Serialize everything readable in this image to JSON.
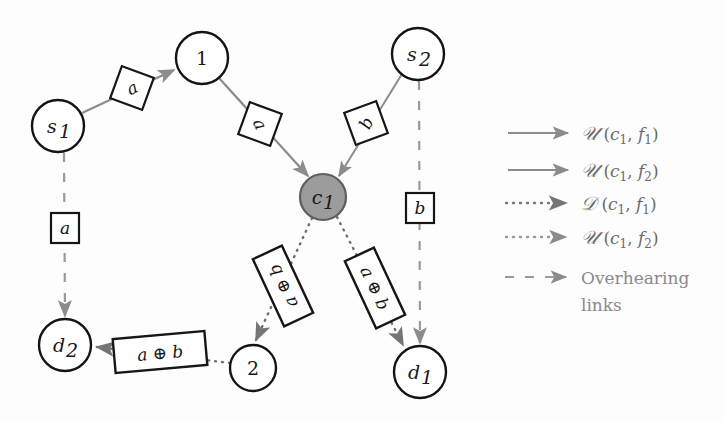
{
  "figure": {
    "background_color": "#fdfdfd",
    "line_color": "#8c8c8c",
    "stroke_color": "#1a1a1a",
    "coding_node_fill": "#9c9c9c"
  },
  "nodes": [
    {
      "id": "s1",
      "label": "s",
      "sub": "1",
      "x": 58,
      "y": 126,
      "r": 26,
      "fill": "#ffffff",
      "name": "node-s1"
    },
    {
      "id": "n1",
      "label": "1",
      "sub": "",
      "x": 202,
      "y": 58,
      "r": 26,
      "fill": "#ffffff",
      "name": "node-1"
    },
    {
      "id": "s2",
      "label": "s",
      "sub": "2",
      "x": 418,
      "y": 54,
      "r": 26,
      "fill": "#ffffff",
      "name": "node-s2"
    },
    {
      "id": "c1",
      "label": "c",
      "sub": "1",
      "x": 323,
      "y": 197,
      "r": 23,
      "fill": "#9c9c9c",
      "name": "node-c1"
    },
    {
      "id": "d2",
      "label": "d",
      "sub": "2",
      "x": 65,
      "y": 345,
      "r": 26,
      "fill": "#ffffff",
      "name": "node-d2"
    },
    {
      "id": "n2",
      "label": "2",
      "sub": "",
      "x": 253,
      "y": 368,
      "r": 23,
      "fill": "#ffffff",
      "name": "node-2"
    },
    {
      "id": "d1",
      "label": "d",
      "sub": "1",
      "x": 420,
      "y": 372,
      "r": 26,
      "fill": "#ffffff",
      "name": "node-d1"
    }
  ],
  "packet_labels": [
    {
      "id": "p-a-s1-n1",
      "text": "a",
      "x": 132,
      "y": 88,
      "w": 34,
      "h": 34,
      "rot": -25,
      "shape": "diamond",
      "name": "packet-label-a-s1-to-1"
    },
    {
      "id": "p-a-n1-c1",
      "text": "a",
      "x": 260,
      "y": 124,
      "w": 34,
      "h": 34,
      "rot": 65,
      "shape": "diamond",
      "name": "packet-label-a-1-to-c1"
    },
    {
      "id": "p-b-s2-c1",
      "text": "b",
      "x": 366,
      "y": 123,
      "w": 34,
      "h": 34,
      "rot": -65,
      "shape": "diamond",
      "name": "packet-label-b-s2-to-c1"
    },
    {
      "id": "p-a-over",
      "text": "a",
      "x": 65,
      "y": 228,
      "w": 28,
      "h": 30,
      "rot": 0,
      "shape": "rect",
      "name": "packet-label-a-overhear"
    },
    {
      "id": "p-b-over",
      "text": "b",
      "x": 420,
      "y": 208,
      "w": 28,
      "h": 30,
      "rot": 0,
      "shape": "rect",
      "name": "packet-label-b-overhear"
    },
    {
      "id": "p-ab-left",
      "text": "a ⊕ b",
      "x": 283,
      "y": 286,
      "w": 74,
      "h": 32,
      "rot": -115,
      "shape": "rect",
      "name": "packet-label-ab-c1-to-2"
    },
    {
      "id": "p-ab-right",
      "text": "a ⊕ b",
      "x": 375,
      "y": 288,
      "w": 74,
      "h": 32,
      "rot": 65,
      "shape": "rect",
      "name": "packet-label-ab-c1-to-d1"
    },
    {
      "id": "p-ab-bot",
      "text": "a ⊕ b",
      "x": 160,
      "y": 352,
      "w": 92,
      "h": 34,
      "rot": -5,
      "shape": "rect",
      "name": "packet-label-ab-2-to-d2"
    }
  ],
  "legend": {
    "rows": [
      {
        "id": "u-c1-f1",
        "style": "solid",
        "cal": "𝒰",
        "open": " (",
        "v1": "c",
        "v1s": "1",
        "comma": ", ",
        "v2": "f",
        "v2s": "1",
        "close": ")",
        "name": "legend-item-u-c1-f1"
      },
      {
        "id": "u-c1-f2",
        "style": "solid",
        "cal": "𝒰",
        "open": " (",
        "v1": "c",
        "v1s": "1",
        "comma": ", ",
        "v2": "f",
        "v2s": "2",
        "close": ")",
        "name": "legend-item-u-c1-f2"
      },
      {
        "id": "d-c1-f1",
        "style": "dotted",
        "cal": "𝒟",
        "open": " (",
        "v1": "c",
        "v1s": "1",
        "comma": ", ",
        "v2": "f",
        "v2s": "1",
        "close": ")",
        "name": "legend-item-d-c1-f1"
      },
      {
        "id": "u2-c1-f2",
        "style": "dotted",
        "cal": "𝒰",
        "open": " (",
        "v1": "c",
        "v1s": "1",
        "comma": ", ",
        "v2": "f",
        "v2s": "2",
        "close": ")",
        "name": "legend-item-u-c1-f2-dotted"
      }
    ],
    "overhearing": {
      "style": "dashed",
      "line1": "Overhearing",
      "line2": "links",
      "name": "legend-item-overhearing-links"
    }
  }
}
